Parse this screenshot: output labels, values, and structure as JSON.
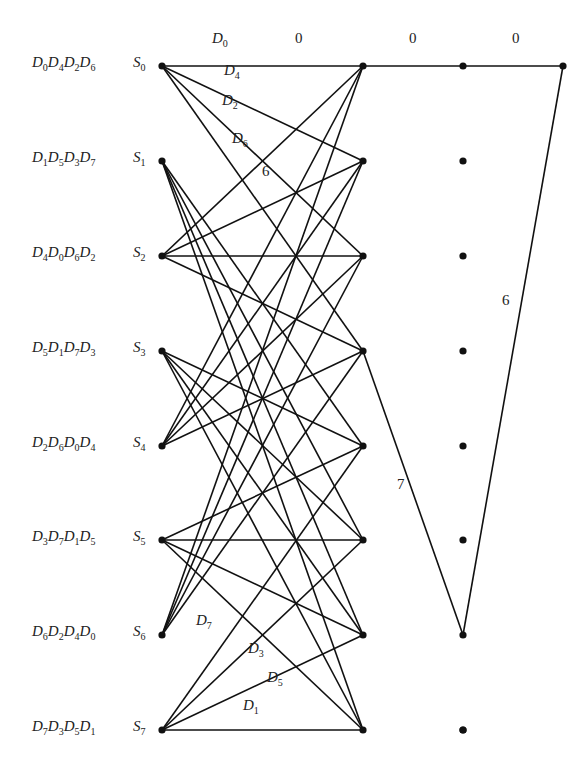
{
  "diagram": {
    "type": "trellis",
    "columns_x": [
      162,
      363,
      463,
      563
    ],
    "rows_y": [
      66,
      161,
      256,
      351,
      446,
      540,
      635,
      730
    ],
    "states": [
      {
        "name": "S",
        "sub": "0",
        "subsets": [
          [
            "D",
            "0"
          ],
          [
            "D",
            "4"
          ],
          [
            "D",
            "2"
          ],
          [
            "D",
            "6"
          ]
        ]
      },
      {
        "name": "S",
        "sub": "1",
        "subsets": [
          [
            "D",
            "1"
          ],
          [
            "D",
            "5"
          ],
          [
            "D",
            "3"
          ],
          [
            "D",
            "7"
          ]
        ]
      },
      {
        "name": "S",
        "sub": "2",
        "subsets": [
          [
            "D",
            "4"
          ],
          [
            "D",
            "0"
          ],
          [
            "D",
            "6"
          ],
          [
            "D",
            "2"
          ]
        ]
      },
      {
        "name": "S",
        "sub": "3",
        "subsets": [
          [
            "D",
            "5"
          ],
          [
            "D",
            "1"
          ],
          [
            "D",
            "7"
          ],
          [
            "D",
            "3"
          ]
        ]
      },
      {
        "name": "S",
        "sub": "4",
        "subsets": [
          [
            "D",
            "2"
          ],
          [
            "D",
            "6"
          ],
          [
            "D",
            "0"
          ],
          [
            "D",
            "4"
          ]
        ]
      },
      {
        "name": "S",
        "sub": "5",
        "subsets": [
          [
            "D",
            "3"
          ],
          [
            "D",
            "7"
          ],
          [
            "D",
            "1"
          ],
          [
            "D",
            "5"
          ]
        ]
      },
      {
        "name": "S",
        "sub": "6",
        "subsets": [
          [
            "D",
            "6"
          ],
          [
            "D",
            "2"
          ],
          [
            "D",
            "4"
          ],
          [
            "D",
            "0"
          ]
        ]
      },
      {
        "name": "S",
        "sub": "7",
        "subsets": [
          [
            "D",
            "7"
          ],
          [
            "D",
            "3"
          ],
          [
            "D",
            "5"
          ],
          [
            "D",
            "1"
          ]
        ]
      }
    ],
    "transitions": [
      {
        "from": 0,
        "to": [
          0,
          1,
          2,
          3
        ]
      },
      {
        "from": 1,
        "to": [
          4,
          5,
          6,
          7
        ]
      },
      {
        "from": 2,
        "to": [
          0,
          1,
          2,
          3
        ]
      },
      {
        "from": 3,
        "to": [
          4,
          5,
          6,
          7
        ]
      },
      {
        "from": 4,
        "to": [
          0,
          1,
          2,
          3
        ]
      },
      {
        "from": 5,
        "to": [
          4,
          5,
          6,
          7
        ]
      },
      {
        "from": 6,
        "to": [
          0,
          1,
          2,
          3
        ]
      },
      {
        "from": 7,
        "to": [
          4,
          5,
          6,
          7
        ]
      }
    ],
    "branch_labels": [
      {
        "base": "D",
        "sub": "0",
        "x": 212,
        "y": 44
      },
      {
        "base": "D",
        "sub": "4",
        "x": 224,
        "y": 76
      },
      {
        "base": "D",
        "sub": "2",
        "x": 222,
        "y": 106
      },
      {
        "base": "D",
        "sub": "6",
        "x": 232,
        "y": 144
      },
      {
        "base": "D",
        "sub": "7",
        "x": 196,
        "y": 626
      },
      {
        "base": "D",
        "sub": "3",
        "x": 248,
        "y": 654
      },
      {
        "base": "D",
        "sub": "5",
        "x": 267,
        "y": 683
      },
      {
        "base": "D",
        "sub": "1",
        "x": 243,
        "y": 711
      }
    ],
    "distance_labels": [
      {
        "text": "0",
        "x": 295,
        "y": 44
      },
      {
        "text": "0",
        "x": 409,
        "y": 44
      },
      {
        "text": "0",
        "x": 512,
        "y": 44
      },
      {
        "text": "6",
        "x": 262,
        "y": 177
      },
      {
        "text": "6",
        "x": 502,
        "y": 306
      },
      {
        "text": "7",
        "x": 397,
        "y": 490
      }
    ],
    "error_path": [
      {
        "col": 0,
        "row": 0
      },
      {
        "col": 1,
        "row": 0
      },
      {
        "col": 2,
        "row": 0
      },
      {
        "col": 3,
        "row": 0
      }
    ],
    "alt_path": [
      {
        "col": 0,
        "row": 0
      },
      {
        "col": 1,
        "row": 3
      },
      {
        "col": 2,
        "row": 6
      },
      {
        "col": 3,
        "row": 0
      }
    ],
    "colors": {
      "line": "#111111",
      "text": "#222222",
      "background": "#ffffff"
    }
  }
}
